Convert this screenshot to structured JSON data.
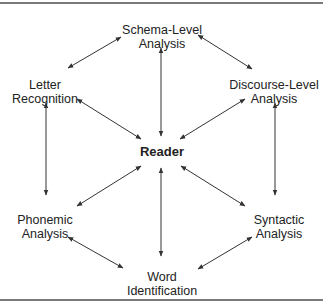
{
  "diagram": {
    "colors": {
      "line": "#333333",
      "text": "#222222",
      "rule": "#7a7a7a"
    },
    "nodes": {
      "schema": {
        "lines": [
          "Schema-Level",
          "Analysis"
        ],
        "x": 162,
        "y": 23
      },
      "letter": {
        "lines": [
          "Letter",
          "Recognition"
        ],
        "x": 45,
        "y": 78
      },
      "discourse": {
        "lines": [
          "Discourse-Level",
          "Analysis"
        ],
        "x": 274,
        "y": 78
      },
      "reader": {
        "lines": [
          "Reader"
        ],
        "x": 162,
        "y": 145
      },
      "phonemic": {
        "lines": [
          "Phonemic",
          "Analysis"
        ],
        "x": 45,
        "y": 213
      },
      "syntactic": {
        "lines": [
          "Syntactic",
          "Analysis"
        ],
        "x": 279,
        "y": 213
      },
      "word": {
        "lines": [
          "Word",
          "Identification"
        ],
        "x": 162,
        "y": 270
      }
    },
    "edges": [
      {
        "from": "schema",
        "to": "letter",
        "x1": 121,
        "y1": 37,
        "x2": 68,
        "y2": 68
      },
      {
        "from": "schema",
        "to": "discourse",
        "x1": 198,
        "y1": 35,
        "x2": 252,
        "y2": 69
      },
      {
        "from": "letter",
        "to": "reader",
        "x1": 77,
        "y1": 99,
        "x2": 141,
        "y2": 139
      },
      {
        "from": "discourse",
        "to": "reader",
        "x1": 245,
        "y1": 99,
        "x2": 180,
        "y2": 139
      },
      {
        "from": "letter",
        "to": "phonemic",
        "x1": 46,
        "y1": 103,
        "x2": 46,
        "y2": 195
      },
      {
        "from": "discourse",
        "to": "syntactic",
        "x1": 275,
        "y1": 103,
        "x2": 275,
        "y2": 195
      },
      {
        "from": "schema",
        "to": "reader",
        "x1": 161,
        "y1": 48,
        "x2": 161,
        "y2": 136
      },
      {
        "from": "reader",
        "to": "word",
        "x1": 161,
        "y1": 168,
        "x2": 161,
        "y2": 256
      },
      {
        "from": "reader",
        "to": "phonemic",
        "x1": 141,
        "y1": 166,
        "x2": 77,
        "y2": 206
      },
      {
        "from": "reader",
        "to": "syntactic",
        "x1": 181,
        "y1": 166,
        "x2": 245,
        "y2": 206
      },
      {
        "from": "phonemic",
        "to": "word",
        "x1": 68,
        "y1": 237,
        "x2": 123,
        "y2": 268
      },
      {
        "from": "syntactic",
        "to": "word",
        "x1": 252,
        "y1": 237,
        "x2": 198,
        "y2": 269
      }
    ]
  }
}
